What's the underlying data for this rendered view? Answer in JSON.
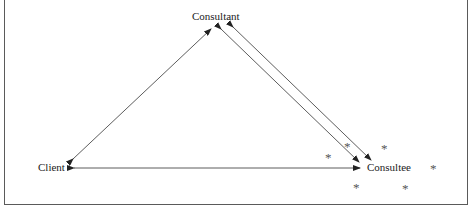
{
  "diagram": {
    "nodes": {
      "consultant": "Consultant",
      "client": "Client",
      "consultee": "Consultee"
    },
    "edges": [
      {
        "from": "client",
        "to": "consultant",
        "direction": "bidirectional"
      },
      {
        "from": "client",
        "to": "consultee",
        "direction": "bidirectional"
      },
      {
        "from": "consultant",
        "to": "consultee",
        "direction": "to-consultee"
      },
      {
        "from": "consultee",
        "to": "consultant",
        "direction": "to-consultant"
      }
    ],
    "markers": {
      "glyph": "*",
      "count": 6
    },
    "colors": {
      "line": "#333333",
      "text": "#222222",
      "frame": "#5a5a5a"
    }
  }
}
